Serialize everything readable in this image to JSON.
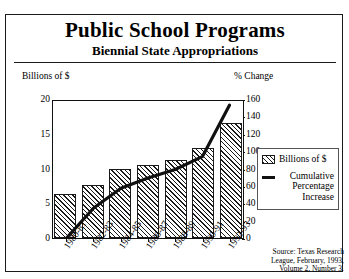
{
  "header": {
    "title": "Public School Programs",
    "subtitle": "Biennial State Appropriations"
  },
  "axes": {
    "left_title": "Billions of $",
    "right_title": "% Change",
    "left_ticks": [
      "20",
      "15",
      "10",
      "5",
      "0"
    ],
    "right_ticks": [
      "160",
      "140",
      "120",
      "100",
      "80",
      "60",
      "40",
      "20",
      "0"
    ]
  },
  "legend": {
    "items": [
      {
        "swatch": "hatch-swatch",
        "label": "Billions of $"
      },
      {
        "swatch": "line-swatch",
        "label": "Cumulative Percentage Increase"
      }
    ]
  },
  "source": {
    "label": "Source:",
    "text": "Texas Research League, February, 1993, Volume 2, Number 3."
  },
  "chart_data": {
    "type": "bar",
    "title": "Public School Programs",
    "subtitle": "Biennial State Appropriations",
    "categories": [
      "1980-81",
      "1982-83",
      "1984-85",
      "1986-87",
      "1988-89",
      "1990-91",
      "1992-93"
    ],
    "xlabel": "",
    "ylabel": "Billions of $",
    "ylim": [
      0,
      20
    ],
    "y2label": "% Change",
    "y2lim": [
      0,
      160
    ],
    "grid": false,
    "legend_position": "right",
    "series": [
      {
        "name": "Billions of $",
        "type": "bar",
        "axis": "left",
        "values": [
          6.4,
          7.7,
          9.9,
          10.5,
          11.2,
          13.0,
          16.5
        ]
      },
      {
        "name": "Cumulative Percentage Increase",
        "type": "line",
        "axis": "right",
        "values": [
          0,
          35,
          58,
          70,
          80,
          95,
          155
        ]
      }
    ]
  }
}
